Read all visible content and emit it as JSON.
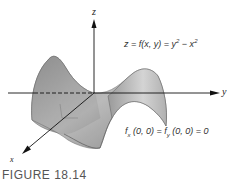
{
  "figure": {
    "caption": "FIGURE 18.14",
    "equation_surface": {
      "lhs": "z = f(x, y) = y",
      "exp1": "2",
      "mid": " − x",
      "exp2": "2"
    },
    "equation_partials": {
      "f1": "f",
      "sub1": "x",
      "args1": " (0, 0) = ",
      "f2": "f",
      "sub2": "y",
      "args2": " (0, 0) = 0"
    },
    "axes": {
      "x_label": "x",
      "y_label": "y",
      "z_label": "z"
    },
    "colors": {
      "surface_light": "#c9c9c9",
      "surface_dark": "#8a8a8a",
      "axis": "#111111",
      "text": "#333333"
    }
  }
}
